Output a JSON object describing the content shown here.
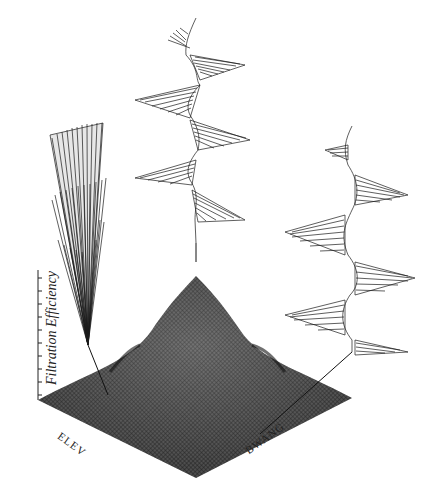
{
  "figure": {
    "type": "3d-surface-with-insets",
    "z_axis_label": "Filtration Efficiency",
    "x_axis_label": "ELEV",
    "y_axis_label": "BWANG",
    "z_ticks_count": 10,
    "colors": {
      "ink": "#1a1a1a",
      "surface": "#444444",
      "background": "#ffffff"
    },
    "insets": [
      {
        "name": "left-inset",
        "description": "narrow cone-shaped fiber array (side view)"
      },
      {
        "name": "top-inset",
        "description": "helical fan array (peak efficiency)"
      },
      {
        "name": "right-inset",
        "description": "horizontal zig-zag fan array"
      }
    ]
  }
}
